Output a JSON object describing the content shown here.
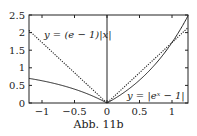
{
  "figure": {
    "caption": "Abb. 11b"
  },
  "chart_data": {
    "type": "line",
    "title": "",
    "xlabel": "",
    "ylabel": "",
    "xlim": [
      -1.2,
      1.25
    ],
    "ylim": [
      0,
      2.5
    ],
    "x_ticks": [
      "-1",
      "-0.5",
      "0",
      "0.5",
      "1"
    ],
    "y_ticks": [
      "0",
      "0.5",
      "1",
      "1.5",
      "2",
      "2.5"
    ],
    "grid": false,
    "series": [
      {
        "name": "y = (e - 1)|x|",
        "style": "dotted",
        "function": "(e-1)*abs(x)"
      },
      {
        "name": "y = |e^x - 1|",
        "style": "solid",
        "function": "abs(exp(x)-1)"
      }
    ],
    "annotations": [
      {
        "text": "y = (e − 1)|x|",
        "position": "upper-left"
      },
      {
        "text": "y = |eˣ − 1|",
        "position": "lower-right"
      }
    ]
  }
}
